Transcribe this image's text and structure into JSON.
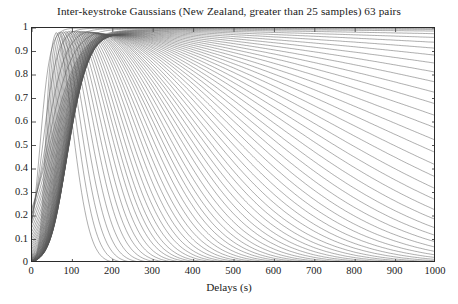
{
  "chart_data": {
    "type": "line",
    "title": "Inter-keystroke Gaussians (New Zealand, greater than 25 samples) 63 pairs",
    "xlabel": "Delays (s)",
    "ylabel": "",
    "xlim": [
      0,
      1000
    ],
    "ylim": [
      0,
      1
    ],
    "xticks": [
      0,
      100,
      200,
      300,
      400,
      500,
      600,
      700,
      800,
      900,
      1000
    ],
    "xtick_labels": [
      "0",
      "100",
      "200",
      "300",
      "400",
      "500",
      "600",
      "700",
      "800",
      "900",
      "1000"
    ],
    "yticks": [
      0,
      0.1,
      0.2,
      0.3,
      0.4,
      0.5,
      0.6,
      0.7,
      0.8,
      0.9,
      1
    ],
    "ytick_labels": [
      "0",
      "0.1",
      "0.2",
      "0.3",
      "0.4",
      "0.5",
      "0.6",
      "0.7",
      "0.8",
      "0.9",
      "1"
    ],
    "grid": false,
    "legend": "none",
    "n_series": 63,
    "line_color": "#555555",
    "series_note": "63 Gaussian curves; each rises steeply from near x=0, peaks at amplitude ~1 between x=60 and x=170, then decays with widely varying decay lengths; roughly 20 curves fall to 0 before x=450, the rest decay slowly and remain between 0.15 and 0.95 at x=1000",
    "series": [
      {
        "name": "pair 1",
        "peak_x": 60,
        "rise": 26,
        "decay": 70,
        "amp": 1.0,
        "y_at_1000": 0.0
      },
      {
        "name": "pair 2",
        "peak_x": 66,
        "rise": 28,
        "decay": 78,
        "amp": 1.0,
        "y_at_1000": 0.0
      },
      {
        "name": "pair 3",
        "peak_x": 72,
        "rise": 30,
        "decay": 86,
        "amp": 1.0,
        "y_at_1000": 0.0
      },
      {
        "name": "pair 4",
        "peak_x": 78,
        "rise": 32,
        "decay": 94,
        "amp": 1.0,
        "y_at_1000": 0.0
      },
      {
        "name": "pair 5",
        "peak_x": 84,
        "rise": 34,
        "decay": 102,
        "amp": 1.0,
        "y_at_1000": 0.0
      },
      {
        "name": "pair 6",
        "peak_x": 90,
        "rise": 36,
        "decay": 110,
        "amp": 1.0,
        "y_at_1000": 0.0
      },
      {
        "name": "pair 7",
        "peak_x": 95,
        "rise": 38,
        "decay": 118,
        "amp": 1.0,
        "y_at_1000": 0.0
      },
      {
        "name": "pair 8",
        "peak_x": 100,
        "rise": 40,
        "decay": 126,
        "amp": 1.0,
        "y_at_1000": 0.0
      },
      {
        "name": "pair 9",
        "peak_x": 105,
        "rise": 42,
        "decay": 134,
        "amp": 1.0,
        "y_at_1000": 0.0
      },
      {
        "name": "pair 10",
        "peak_x": 110,
        "rise": 44,
        "decay": 142,
        "amp": 1.0,
        "y_at_1000": 0.01
      },
      {
        "name": "pair 11",
        "peak_x": 114,
        "rise": 46,
        "decay": 150,
        "amp": 1.0,
        "y_at_1000": 0.01
      },
      {
        "name": "pair 12",
        "peak_x": 118,
        "rise": 48,
        "decay": 158,
        "amp": 1.0,
        "y_at_1000": 0.02
      },
      {
        "name": "pair 13",
        "peak_x": 122,
        "rise": 50,
        "decay": 167,
        "amp": 1.0,
        "y_at_1000": 0.02
      },
      {
        "name": "pair 14",
        "peak_x": 126,
        "rise": 52,
        "decay": 176,
        "amp": 1.0,
        "y_at_1000": 0.03
      },
      {
        "name": "pair 15",
        "peak_x": 130,
        "rise": 54,
        "decay": 185,
        "amp": 1.0,
        "y_at_1000": 0.04
      },
      {
        "name": "pair 16",
        "peak_x": 134,
        "rise": 56,
        "decay": 195,
        "amp": 1.0,
        "y_at_1000": 0.05
      },
      {
        "name": "pair 17",
        "peak_x": 138,
        "rise": 58,
        "decay": 205,
        "amp": 1.0,
        "y_at_1000": 0.07
      },
      {
        "name": "pair 18",
        "peak_x": 141,
        "rise": 60,
        "decay": 216,
        "amp": 1.0,
        "y_at_1000": 0.09
      },
      {
        "name": "pair 19",
        "peak_x": 144,
        "rise": 62,
        "decay": 228,
        "amp": 1.0,
        "y_at_1000": 0.11
      },
      {
        "name": "pair 20",
        "peak_x": 147,
        "rise": 64,
        "decay": 240,
        "amp": 1.0,
        "y_at_1000": 0.14
      },
      {
        "name": "pair 21",
        "peak_x": 150,
        "rise": 66,
        "decay": 253,
        "amp": 1.0,
        "y_at_1000": 0.17
      },
      {
        "name": "pair 22",
        "peak_x": 152,
        "rise": 68,
        "decay": 266,
        "amp": 1.0,
        "y_at_1000": 0.2
      },
      {
        "name": "pair 23",
        "peak_x": 154,
        "rise": 70,
        "decay": 280,
        "amp": 1.0,
        "y_at_1000": 0.23
      },
      {
        "name": "pair 24",
        "peak_x": 156,
        "rise": 72,
        "decay": 295,
        "amp": 1.0,
        "y_at_1000": 0.26
      },
      {
        "name": "pair 25",
        "peak_x": 158,
        "rise": 74,
        "decay": 311,
        "amp": 1.0,
        "y_at_1000": 0.3
      },
      {
        "name": "pair 26",
        "peak_x": 160,
        "rise": 76,
        "decay": 328,
        "amp": 1.0,
        "y_at_1000": 0.33
      },
      {
        "name": "pair 27",
        "peak_x": 161,
        "rise": 78,
        "decay": 346,
        "amp": 1.0,
        "y_at_1000": 0.37
      },
      {
        "name": "pair 28",
        "peak_x": 162,
        "rise": 80,
        "decay": 365,
        "amp": 1.0,
        "y_at_1000": 0.41
      },
      {
        "name": "pair 29",
        "peak_x": 163,
        "rise": 82,
        "decay": 385,
        "amp": 1.0,
        "y_at_1000": 0.44
      },
      {
        "name": "pair 30",
        "peak_x": 164,
        "rise": 84,
        "decay": 406,
        "amp": 1.0,
        "y_at_1000": 0.48
      },
      {
        "name": "pair 31",
        "peak_x": 164,
        "rise": 86,
        "decay": 428,
        "amp": 1.0,
        "y_at_1000": 0.51
      },
      {
        "name": "pair 32",
        "peak_x": 165,
        "rise": 88,
        "decay": 452,
        "amp": 1.0,
        "y_at_1000": 0.55
      },
      {
        "name": "pair 33",
        "peak_x": 165,
        "rise": 90,
        "decay": 478,
        "amp": 1.0,
        "y_at_1000": 0.58
      },
      {
        "name": "pair 34",
        "peak_x": 166,
        "rise": 92,
        "decay": 505,
        "amp": 1.0,
        "y_at_1000": 0.61
      },
      {
        "name": "pair 35",
        "peak_x": 166,
        "rise": 94,
        "decay": 535,
        "amp": 1.0,
        "y_at_1000": 0.64
      },
      {
        "name": "pair 36",
        "peak_x": 166,
        "rise": 96,
        "decay": 567,
        "amp": 1.0,
        "y_at_1000": 0.67
      },
      {
        "name": "pair 37",
        "peak_x": 166,
        "rise": 98,
        "decay": 602,
        "amp": 1.0,
        "y_at_1000": 0.7
      },
      {
        "name": "pair 38",
        "peak_x": 165,
        "rise": 100,
        "decay": 640,
        "amp": 1.0,
        "y_at_1000": 0.73
      },
      {
        "name": "pair 39",
        "peak_x": 165,
        "rise": 102,
        "decay": 681,
        "amp": 1.0,
        "y_at_1000": 0.75
      },
      {
        "name": "pair 40",
        "peak_x": 164,
        "rise": 104,
        "decay": 726,
        "amp": 1.0,
        "y_at_1000": 0.78
      },
      {
        "name": "pair 41",
        "peak_x": 163,
        "rise": 106,
        "decay": 776,
        "amp": 1.0,
        "y_at_1000": 0.8
      },
      {
        "name": "pair 42",
        "peak_x": 162,
        "rise": 108,
        "decay": 831,
        "amp": 1.0,
        "y_at_1000": 0.82
      },
      {
        "name": "pair 43",
        "peak_x": 160,
        "rise": 110,
        "decay": 892,
        "amp": 1.0,
        "y_at_1000": 0.84
      },
      {
        "name": "pair 44",
        "peak_x": 158,
        "rise": 112,
        "decay": 960,
        "amp": 1.0,
        "y_at_1000": 0.85
      },
      {
        "name": "pair 45",
        "peak_x": 156,
        "rise": 114,
        "decay": 1037,
        "amp": 1.0,
        "y_at_1000": 0.87
      },
      {
        "name": "pair 46",
        "peak_x": 153,
        "rise": 116,
        "decay": 1124,
        "amp": 1.0,
        "y_at_1000": 0.88
      },
      {
        "name": "pair 47",
        "peak_x": 150,
        "rise": 118,
        "decay": 1223,
        "amp": 1.0,
        "y_at_1000": 0.9
      },
      {
        "name": "pair 48",
        "peak_x": 146,
        "rise": 120,
        "decay": 1337,
        "amp": 1.0,
        "y_at_1000": 0.91
      },
      {
        "name": "pair 49",
        "peak_x": 142,
        "rise": 122,
        "decay": 1470,
        "amp": 1.0,
        "y_at_1000": 0.92
      },
      {
        "name": "pair 50",
        "peak_x": 138,
        "rise": 124,
        "decay": 1627,
        "amp": 1.0,
        "y_at_1000": 0.93
      },
      {
        "name": "pair 51",
        "peak_x": 133,
        "rise": 126,
        "decay": 1814,
        "amp": 1.0,
        "y_at_1000": 0.94
      },
      {
        "name": "pair 52",
        "peak_x": 128,
        "rise": 128,
        "decay": 2042,
        "amp": 1.0,
        "y_at_1000": 0.95
      },
      {
        "name": "pair 53",
        "peak_x": 122,
        "rise": 130,
        "decay": 2323,
        "amp": 1.0,
        "y_at_1000": 0.96
      },
      {
        "name": "pair 54",
        "peak_x": 116,
        "rise": 132,
        "decay": 2680,
        "amp": 1.0,
        "y_at_1000": 0.96
      },
      {
        "name": "pair 55",
        "peak_x": 109,
        "rise": 134,
        "decay": 3145,
        "amp": 1.0,
        "y_at_1000": 0.97
      },
      {
        "name": "pair 56",
        "peak_x": 102,
        "rise": 136,
        "decay": 3770,
        "amp": 1.0,
        "y_at_1000": 0.97
      },
      {
        "name": "pair 57",
        "peak_x": 95,
        "rise": 138,
        "decay": 4650,
        "amp": 1.0,
        "y_at_1000": 0.98
      },
      {
        "name": "pair 58",
        "peak_x": 87,
        "rise": 140,
        "decay": 5960,
        "amp": 1.0,
        "y_at_1000": 0.98
      },
      {
        "name": "pair 59",
        "peak_x": 79,
        "rise": 142,
        "decay": 8100,
        "amp": 1.0,
        "y_at_1000": 0.99
      },
      {
        "name": "pair 60",
        "peak_x": 70,
        "rise": 120,
        "decay": 12000,
        "amp": 1.0,
        "y_at_1000": 0.99
      },
      {
        "name": "pair 61",
        "peak_x": 60,
        "rise": 95,
        "decay": 20000,
        "amp": 1.0,
        "y_at_1000": 0.99
      },
      {
        "name": "pair 62",
        "peak_x": 48,
        "rise": 70,
        "decay": 40000,
        "amp": 1.0,
        "y_at_1000": 1.0
      },
      {
        "name": "pair 63",
        "peak_x": 36,
        "rise": 48,
        "decay": 90000,
        "amp": 1.0,
        "y_at_1000": 1.0
      }
    ]
  }
}
